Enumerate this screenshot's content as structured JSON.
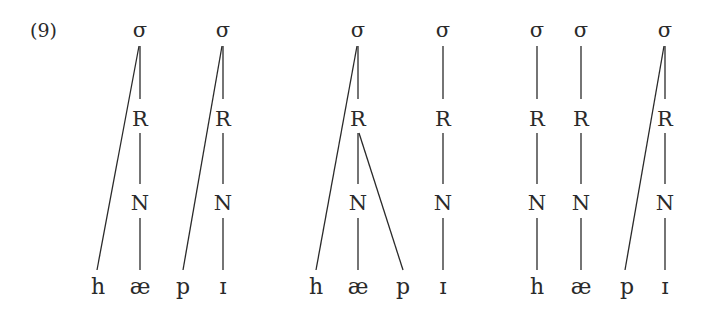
{
  "example_number": "(9)",
  "node_labels": {
    "syllable": "σ",
    "rime": "R",
    "nucleus": "N"
  },
  "trees": [
    {
      "id": "tree-1",
      "segments": [
        "h",
        "æ",
        "p",
        "ɪ"
      ],
      "syllables": [
        {
          "sigma": "σ",
          "rime": "R",
          "nucleus": "N",
          "onset": "h",
          "nucleus_segment": "æ"
        },
        {
          "sigma": "σ",
          "rime": "R",
          "nucleus": "N",
          "onset": "p",
          "nucleus_segment": "ɪ"
        }
      ]
    },
    {
      "id": "tree-2",
      "segments": [
        "h",
        "æ",
        "p",
        "ɪ"
      ],
      "syllables": [
        {
          "sigma": "σ",
          "rime": "R",
          "nucleus": "N",
          "onset": "h",
          "nucleus_segment": "æ",
          "coda": "p"
        },
        {
          "sigma": "σ",
          "rime": "R",
          "nucleus": "N",
          "nucleus_segment": "ɪ"
        }
      ]
    },
    {
      "id": "tree-3",
      "segments": [
        "h",
        "æ",
        "p",
        "ɪ"
      ],
      "syllables": [
        {
          "sigma": "σ",
          "rime": "R",
          "nucleus": "N",
          "nucleus_segment": "h"
        },
        {
          "sigma": "σ",
          "rime": "R",
          "nucleus": "N",
          "nucleus_segment": "æ"
        },
        {
          "sigma": "σ",
          "rime": "R",
          "nucleus": "N",
          "onset": "p",
          "nucleus_segment": "ɪ"
        }
      ]
    }
  ]
}
